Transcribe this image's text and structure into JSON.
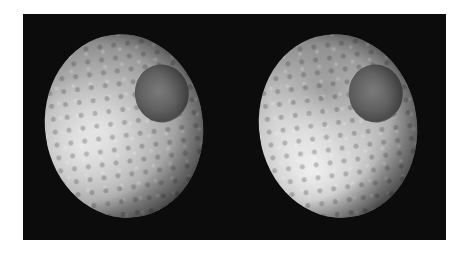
{
  "image": {
    "description": "Two side-by-side grayscale views of a heavily cratered moon with a large crater near the upper right, on a black background",
    "panels": [
      {
        "id": "left",
        "subject": "cratered moon, uniform shading"
      },
      {
        "id": "right",
        "subject": "cratered moon, contrasting dark upper band and bright lower region"
      }
    ],
    "colors": {
      "page_background": "#ffffff",
      "frame_background": "#0c0c0c"
    }
  }
}
